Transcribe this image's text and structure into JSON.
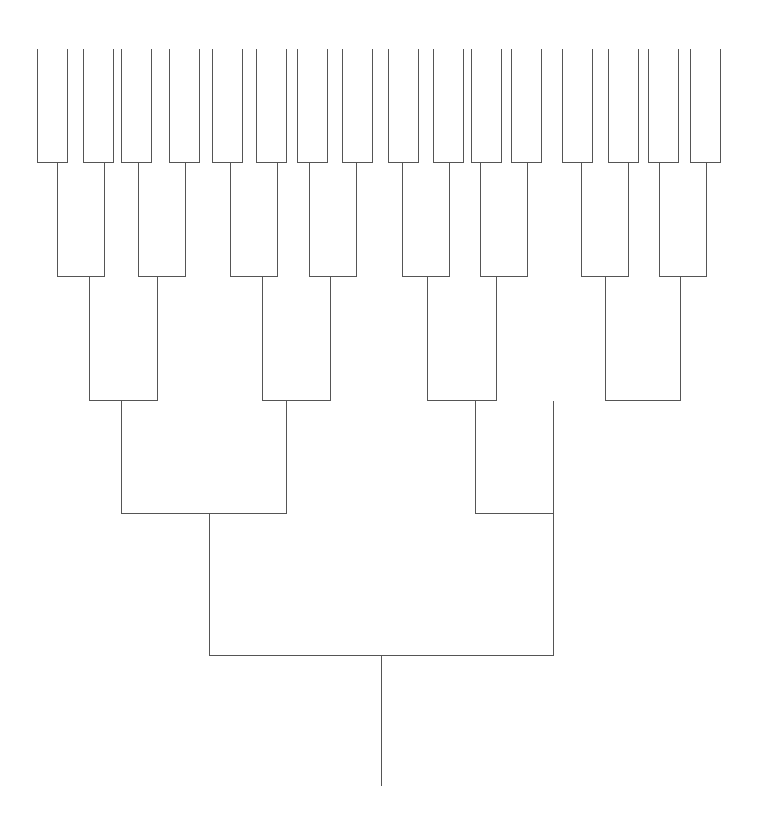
{
  "diagram": {
    "type": "dendrogram",
    "orientation": "root-bottom",
    "line_color": "#555555",
    "background": "#ffffff",
    "leaf_top_y": 48,
    "root_bottom_y": 785,
    "leaves_x": [
      37,
      67,
      83,
      113,
      121,
      151,
      169,
      199,
      212,
      242,
      256,
      286,
      297,
      327,
      342,
      372,
      388,
      418,
      433,
      463,
      471,
      501,
      511,
      541,
      562,
      592,
      608,
      638,
      648,
      678,
      690,
      720
    ],
    "levels": [
      {
        "y": 162,
        "merges": [
          [
            37,
            67
          ],
          [
            83,
            113
          ],
          [
            121,
            151
          ],
          [
            169,
            199
          ],
          [
            212,
            242
          ],
          [
            256,
            286
          ],
          [
            297,
            327
          ],
          [
            342,
            372
          ],
          [
            388,
            418
          ],
          [
            433,
            463
          ],
          [
            471,
            501
          ],
          [
            511,
            541
          ],
          [
            562,
            592
          ],
          [
            608,
            638
          ],
          [
            648,
            678
          ],
          [
            690,
            720
          ]
        ]
      },
      {
        "y": 276,
        "merges": [
          [
            57,
            104
          ],
          [
            138,
            185
          ],
          [
            230,
            277
          ],
          [
            309,
            356
          ],
          [
            402,
            449
          ],
          [
            480,
            527
          ],
          [
            581,
            628
          ],
          [
            659,
            706
          ]
        ]
      },
      {
        "y": 400,
        "merges": [
          [
            89,
            157
          ],
          [
            262,
            330
          ],
          [
            427,
            496
          ],
          [
            605,
            680
          ]
        ]
      },
      {
        "y": 513,
        "merges": [
          [
            121,
            286
          ],
          [
            475,
            553
          ]
        ]
      },
      {
        "y": 655,
        "merges": [
          [
            209,
            553
          ]
        ]
      }
    ],
    "root_x": 381
  }
}
